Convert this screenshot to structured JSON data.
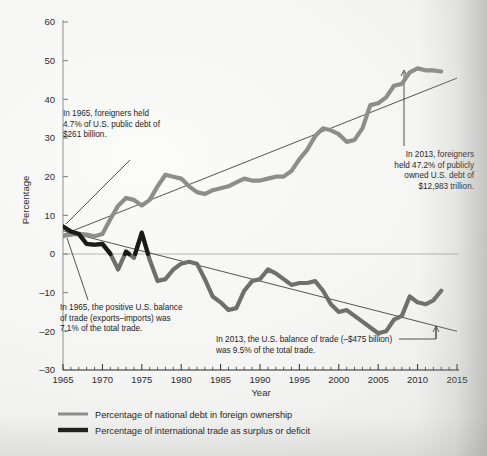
{
  "figure": {
    "axis_x_label": "Year",
    "axis_y_label": "Percentage"
  },
  "legend": {
    "items": [
      {
        "label": "Percentage of national debt in foreign ownership",
        "color": "#8d8d8d",
        "weight": "thin"
      },
      {
        "label": "Percentage of international trade as surplus or deficit",
        "color": "#1a1a1a",
        "weight": "thick"
      }
    ]
  },
  "annotations": [
    {
      "id": "debt-1965",
      "lines": [
        "In 1965, foreigners held",
        "4.7% of U.S. public debt of",
        "$261 billion."
      ],
      "align": "left",
      "x": 63,
      "y": 116
    },
    {
      "id": "debt-2013",
      "lines": [
        "In 2013, foreigners",
        "held 47.2% of publicly",
        "owned U.S. debt of",
        "$12,983 trillion."
      ],
      "align": "right",
      "x": 474,
      "y": 157
    },
    {
      "id": "trade-1965",
      "lines": [
        "In 1965, the positive U.S. balance",
        "of trade (exports–imports) was",
        "7.1% of the total trade."
      ],
      "align": "left",
      "x": 60,
      "y": 310
    },
    {
      "id": "trade-2013",
      "lines": [
        "In 2013, the U.S. balance of trade (–$475 billion)",
        "was 9.5% of the total trade."
      ],
      "align": "left",
      "x": 216,
      "y": 342
    }
  ],
  "chart_data": {
    "type": "line",
    "title": "",
    "xlabel": "Year",
    "ylabel": "Percentage",
    "xlim": [
      1965,
      2015
    ],
    "ylim": [
      -30,
      60
    ],
    "xticks": [
      1965,
      1970,
      1975,
      1980,
      1985,
      1990,
      1995,
      2000,
      2005,
      2010,
      2015
    ],
    "yticks": [
      -30,
      -20,
      -10,
      0,
      10,
      20,
      30,
      40,
      50,
      60
    ],
    "minor_xtick_interval": 1,
    "grid": false,
    "zero_line": true,
    "legend_position": "below",
    "series": [
      {
        "name": "Percentage of national debt in foreign ownership",
        "color": "#8d8d8d",
        "x": [
          1965,
          1966,
          1967,
          1968,
          1969,
          1970,
          1971,
          1972,
          1973,
          1974,
          1975,
          1976,
          1977,
          1978,
          1979,
          1980,
          1981,
          1982,
          1983,
          1984,
          1985,
          1986,
          1987,
          1988,
          1989,
          1990,
          1991,
          1992,
          1993,
          1994,
          1995,
          1996,
          1997,
          1998,
          1999,
          2000,
          2001,
          2002,
          2003,
          2004,
          2005,
          2006,
          2007,
          2008,
          2009,
          2010,
          2011,
          2012,
          2013
        ],
        "values": [
          4.7,
          5.0,
          5.2,
          5.0,
          4.6,
          5.2,
          9.0,
          12.5,
          14.5,
          14.0,
          12.5,
          14.0,
          17.5,
          20.5,
          20.0,
          19.5,
          17.5,
          16.0,
          15.5,
          16.5,
          17.0,
          17.5,
          18.5,
          19.5,
          19.0,
          19.0,
          19.5,
          20.0,
          20.0,
          21.5,
          24.5,
          27.0,
          30.5,
          32.5,
          32.0,
          31.0,
          29.0,
          29.5,
          32.5,
          38.5,
          39.0,
          40.5,
          43.5,
          44.0,
          47.0,
          48.0,
          47.5,
          47.5,
          47.2
        ]
      },
      {
        "name": "Percentage of international trade as surplus or deficit",
        "color_positive": "#1a1a1a",
        "color_negative": "#6f6f6f",
        "x": [
          1965,
          1966,
          1967,
          1968,
          1969,
          1970,
          1971,
          1972,
          1973,
          1974,
          1975,
          1976,
          1977,
          1978,
          1979,
          1980,
          1981,
          1982,
          1983,
          1984,
          1985,
          1986,
          1987,
          1988,
          1989,
          1990,
          1991,
          1992,
          1993,
          1994,
          1995,
          1996,
          1997,
          1998,
          1999,
          2000,
          2001,
          2002,
          2003,
          2004,
          2005,
          2006,
          2007,
          2008,
          2009,
          2010,
          2011,
          2012,
          2013
        ],
        "values": [
          7.1,
          5.8,
          5.2,
          2.6,
          2.4,
          2.6,
          0.1,
          -4.0,
          0.6,
          -1.0,
          5.5,
          -1.5,
          -7.0,
          -6.5,
          -4.0,
          -2.5,
          -2.0,
          -2.5,
          -6.5,
          -11.0,
          -12.5,
          -14.5,
          -14.0,
          -9.5,
          -7.0,
          -6.5,
          -4.0,
          -5.0,
          -6.5,
          -8.0,
          -7.5,
          -7.5,
          -7.0,
          -9.5,
          -13.0,
          -15.0,
          -14.5,
          -16.0,
          -17.5,
          -19.0,
          -20.5,
          -20.0,
          -17.0,
          -16.0,
          -11.0,
          -12.5,
          -13.0,
          -12.0,
          -9.5
        ]
      }
    ],
    "trend_lines": [
      {
        "name": "debt-trend",
        "x": [
          1965,
          2015
        ],
        "y": [
          5.0,
          45.5
        ]
      },
      {
        "name": "trade-trend",
        "x": [
          1965,
          2015
        ],
        "y": [
          6.0,
          -20.0
        ]
      }
    ]
  }
}
